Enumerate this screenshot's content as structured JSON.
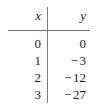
{
  "table": {
    "headers": {
      "x": "x",
      "y": "y"
    },
    "rows": [
      {
        "x": "0",
        "y_sign": "",
        "y_value": "0",
        "y": "0"
      },
      {
        "x": "1",
        "y_sign": "−",
        "y_value": "3",
        "y": "−3"
      },
      {
        "x": "2",
        "y_sign": "−",
        "y_value": "12",
        "y": "−12"
      },
      {
        "x": "3",
        "y_sign": "−",
        "y_value": "27",
        "y": "−27"
      }
    ]
  },
  "chart_data": {
    "type": "table",
    "title": "",
    "xlabel": "x",
    "ylabel": "y",
    "columns": [
      "x",
      "y"
    ],
    "x": [
      0,
      1,
      2,
      3
    ],
    "values": [
      0,
      -3,
      -12,
      -27
    ],
    "series": [
      {
        "name": "y",
        "values": [
          0,
          -3,
          -12,
          -27
        ]
      }
    ],
    "rows": [
      [
        0,
        0
      ],
      [
        1,
        -3
      ],
      [
        2,
        -12
      ],
      [
        3,
        -27
      ]
    ],
    "grid": false,
    "legend": "none"
  },
  "colors": {
    "rule": "#6e6e6e",
    "divider": "#7c7c7c",
    "text": "#1a1a1a",
    "background": "#ffffff"
  }
}
